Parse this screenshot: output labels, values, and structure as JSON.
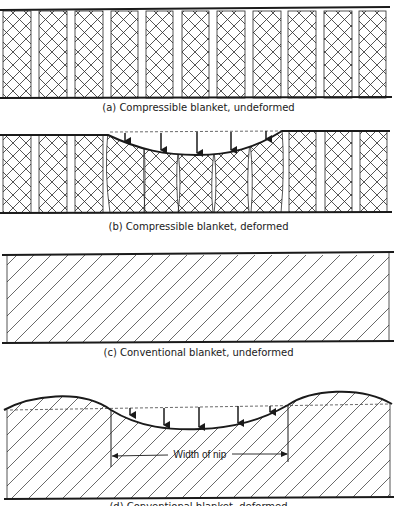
{
  "figure": {
    "panels": [
      {
        "id": "a",
        "caption": "(a) Compressible blanket, undeformed",
        "type": "compressible",
        "state": "undeformed"
      },
      {
        "id": "b",
        "caption": "(b) Compressible blanket, deformed",
        "type": "compressible",
        "state": "deformed"
      },
      {
        "id": "c",
        "caption": "(c) Conventional blanket, undeformed",
        "type": "conventional",
        "state": "undeformed"
      },
      {
        "id": "d",
        "caption": "(d) Conventional blanket, deformed",
        "type": "conventional",
        "state": "deformed",
        "annotation": "Width of nip"
      }
    ],
    "colors": {
      "ink": "#1a1a1a",
      "background": "#ffffff"
    }
  }
}
